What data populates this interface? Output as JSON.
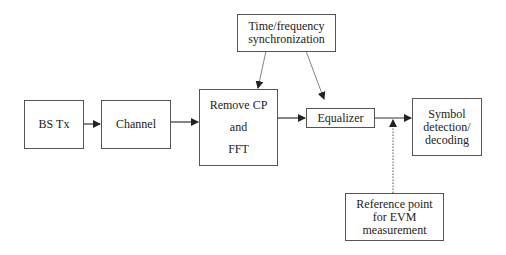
{
  "diagram": {
    "blocks": {
      "bs_tx": {
        "label": "BS Tx"
      },
      "channel": {
        "label": "Channel"
      },
      "remove_cp_fft": {
        "line1": "Remove CP",
        "line2": "and",
        "line3": "FFT"
      },
      "sync": {
        "line1": "Time/frequency",
        "line2": "synchronization"
      },
      "equalizer": {
        "label": "Equalizer"
      },
      "symbol_detection": {
        "line1": "Symbol",
        "line2": "detection/",
        "line3": "decoding"
      },
      "reference_point": {
        "line1": "Reference point",
        "line2": "for EVM",
        "line3": "measurement"
      }
    },
    "connections": [
      {
        "from": "BS Tx",
        "to": "Channel",
        "style": "solid"
      },
      {
        "from": "Channel",
        "to": "Remove CP and FFT",
        "style": "solid"
      },
      {
        "from": "Remove CP and FFT",
        "to": "Equalizer",
        "style": "solid"
      },
      {
        "from": "Equalizer",
        "to": "Symbol detection/decoding",
        "style": "solid"
      },
      {
        "from": "Time/frequency synchronization",
        "to": "Remove CP and FFT",
        "style": "thin"
      },
      {
        "from": "Time/frequency synchronization",
        "to": "Equalizer",
        "style": "thin"
      },
      {
        "from": "Reference point for EVM measurement",
        "to": "Equalizer output",
        "style": "dotted"
      }
    ],
    "colors": {
      "line": "#333333",
      "box_border": "#555555",
      "thin_line": "#777777"
    }
  }
}
